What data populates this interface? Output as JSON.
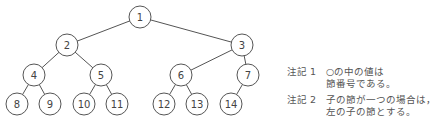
{
  "diagram": {
    "type": "binary-tree",
    "nodes": [
      {
        "id": "1",
        "x": 140,
        "y": 17
      },
      {
        "id": "2",
        "x": 67,
        "y": 45
      },
      {
        "id": "3",
        "x": 242,
        "y": 45
      },
      {
        "id": "4",
        "x": 34,
        "y": 75
      },
      {
        "id": "5",
        "x": 101,
        "y": 75
      },
      {
        "id": "6",
        "x": 181,
        "y": 75
      },
      {
        "id": "7",
        "x": 248,
        "y": 75
      },
      {
        "id": "8",
        "x": 17,
        "y": 104
      },
      {
        "id": "9",
        "x": 50,
        "y": 104
      },
      {
        "id": "10",
        "x": 84,
        "y": 104
      },
      {
        "id": "11",
        "x": 117,
        "y": 104
      },
      {
        "id": "12",
        "x": 164,
        "y": 104
      },
      {
        "id": "13",
        "x": 197,
        "y": 104
      },
      {
        "id": "14",
        "x": 231,
        "y": 104
      }
    ],
    "edges": [
      [
        "1",
        "2"
      ],
      [
        "1",
        "3"
      ],
      [
        "2",
        "4"
      ],
      [
        "2",
        "5"
      ],
      [
        "3",
        "6"
      ],
      [
        "3",
        "7"
      ],
      [
        "4",
        "8"
      ],
      [
        "4",
        "9"
      ],
      [
        "5",
        "10"
      ],
      [
        "5",
        "11"
      ],
      [
        "6",
        "12"
      ],
      [
        "6",
        "13"
      ],
      [
        "7",
        "14"
      ]
    ],
    "node_radius": 11,
    "stroke_color": "#555555"
  },
  "notes": [
    {
      "label": "注記 1",
      "lines": [
        "○の中の値は",
        "節番号である。"
      ]
    },
    {
      "label": "注記 2",
      "lines": [
        "子の節が一つの場合は，",
        "左の子の節とする。"
      ]
    }
  ]
}
